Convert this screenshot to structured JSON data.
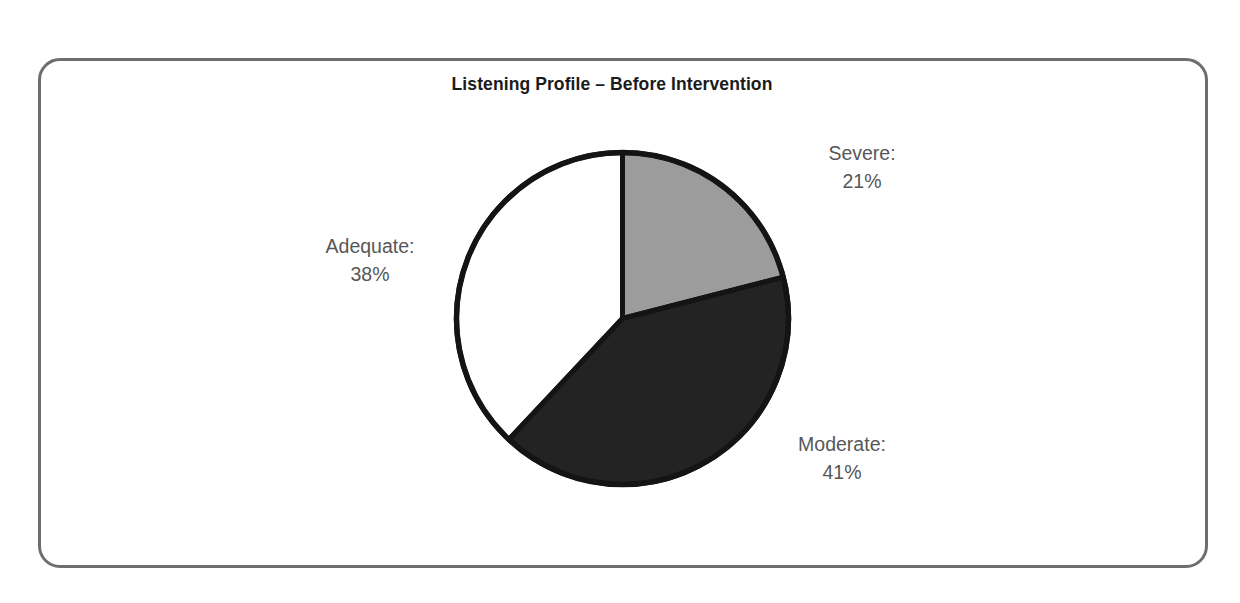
{
  "chart_data": {
    "type": "pie",
    "title": "Listening Profile – Before Intervention",
    "categories": [
      "Severe",
      "Moderate",
      "Adequate"
    ],
    "values": [
      21,
      41,
      38
    ],
    "unit": "%",
    "labels": [
      {
        "name": "Severe:",
        "value": "21%",
        "percent": 21,
        "color": "#9c9c9c"
      },
      {
        "name": "Moderate:",
        "value": "41%",
        "percent": 41,
        "color": "#232323"
      },
      {
        "name": "Adequate:",
        "value": "38%",
        "percent": 38,
        "color": "#ffffff"
      }
    ],
    "start_angle_deg": 0,
    "direction": "clockwise",
    "legend": "none",
    "grid": false,
    "xlabel": "",
    "ylabel": "",
    "outline_color": "#141414",
    "label_text_color": "#575757"
  },
  "frame": {
    "border_color": "#6e6e6e",
    "background": "#ffffff"
  }
}
